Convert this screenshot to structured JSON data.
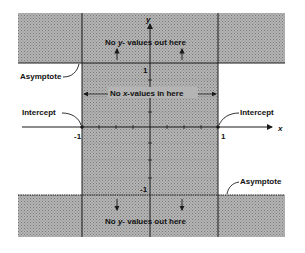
{
  "diagram": {
    "axes": {
      "x_label": "x",
      "y_label": "y"
    },
    "ticks": {
      "x_neg": "-1",
      "x_pos": "1",
      "y_pos": "1",
      "y_neg": "-1"
    },
    "top_note": {
      "prefix": "No ",
      "var": "y",
      "suffix": "- values out here"
    },
    "bottom_note": {
      "prefix": "No ",
      "var": "y",
      "suffix": "- values out here"
    },
    "middle_note": {
      "prefix": "No ",
      "var": "x",
      "suffix": "-values in here"
    },
    "labels": {
      "asymptote_top": "Asymptote",
      "asymptote_bottom": "Asymptote",
      "intercept_left": "Intercept",
      "intercept_right": "Intercept"
    },
    "colors": {
      "shade": "#a9a9a9",
      "line": "#1a1a1a",
      "background": "#ffffff"
    }
  }
}
